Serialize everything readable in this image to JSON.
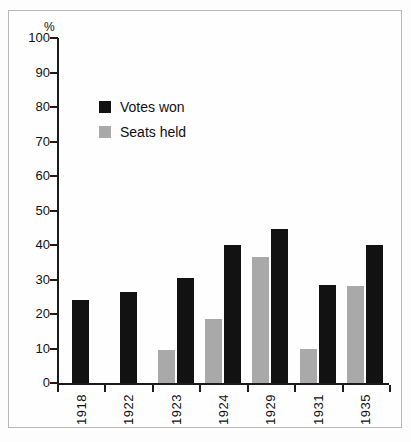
{
  "chart_data": {
    "type": "bar",
    "title": "",
    "xlabel": "",
    "ylabel": "%",
    "ylim": [
      0,
      100
    ],
    "ytick_step": 10,
    "grid": false,
    "legend_position": "upper-left-inside",
    "categories": [
      "1918",
      "1922",
      "1923",
      "1924",
      "1929",
      "1931",
      "1935"
    ],
    "series": [
      {
        "name": "Votes won",
        "color": "#121212",
        "values": [
          24,
          26.5,
          30.5,
          40,
          44.5,
          28.5,
          40
        ]
      },
      {
        "name": "Seats held",
        "color": "#a9a9a9",
        "values": [
          null,
          null,
          9.5,
          18.5,
          36.5,
          10,
          28
        ]
      }
    ],
    "yticks": [
      "0",
      "10",
      "20",
      "30",
      "40",
      "50",
      "60",
      "70",
      "80",
      "90",
      "100"
    ]
  },
  "legend": {
    "items": [
      {
        "label": "Votes won",
        "swatch": "black-square-icon"
      },
      {
        "label": "Seats held",
        "swatch": "gray-square-icon"
      }
    ]
  },
  "axis": {
    "y_unit_label": "%"
  }
}
